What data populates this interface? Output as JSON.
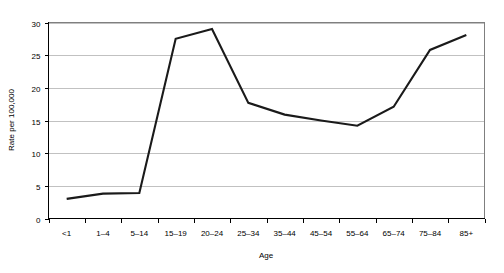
{
  "chart_data": {
    "type": "line",
    "title": "",
    "subtitle": "",
    "xlabel": "Age",
    "ylabel": "Rate per 100,000",
    "categories": [
      "<1",
      "1–4",
      "5–14",
      "15–19",
      "20–24",
      "25–34",
      "35–44",
      "45–54",
      "55–64",
      "65–74",
      "75–84",
      "85+"
    ],
    "values": [
      3.0,
      3.8,
      3.9,
      27.5,
      29.0,
      17.7,
      15.9,
      15.0,
      14.2,
      17.1,
      25.8,
      28.1
    ],
    "series": [
      {
        "name": "Rate",
        "values": [
          3.0,
          3.8,
          3.9,
          27.5,
          29.0,
          17.7,
          15.9,
          15.0,
          14.2,
          17.1,
          25.8,
          28.1
        ]
      }
    ],
    "ylim": [
      0,
      30
    ],
    "ytick_labels": [
      "0",
      "5",
      "10",
      "15",
      "20",
      "25",
      "30"
    ],
    "ytick_values": [
      0,
      5,
      10,
      15,
      20,
      25,
      30
    ],
    "grid": true,
    "grid_axis": "y",
    "legend": false,
    "legend_position": "none",
    "annotations": []
  },
  "colors": {
    "series_line": "#1a1a1a",
    "grid": "#a6a6a6",
    "frame": "#7f7f7f",
    "axis": "#000000",
    "background": "#ffffff",
    "text": "#000000"
  },
  "yaxis": {
    "title": "Rate per 100,000",
    "ticks": [
      "0",
      "5",
      "10",
      "15",
      "20",
      "25",
      "30"
    ]
  },
  "xaxis": {
    "title": "Age",
    "ticks": [
      "<1",
      "1–4",
      "5–14",
      "15–19",
      "20–24",
      "25–34",
      "35–44",
      "45–54",
      "55–64",
      "65–74",
      "75–84",
      "85+"
    ]
  }
}
